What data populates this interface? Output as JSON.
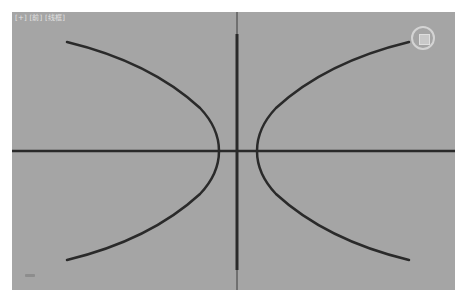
{
  "viewport": {
    "label_parts": [
      "[+]",
      "[前]",
      "[线框]"
    ],
    "background_color": "#a5a5a5",
    "line_color": "#2a2a2a"
  },
  "scene": {
    "objects": [
      {
        "name": "hyperbola-left-branch",
        "type": "curve",
        "start": [
          67,
          42
        ],
        "vertex": [
          219,
          151
        ],
        "end": [
          67,
          260
        ]
      },
      {
        "name": "hyperbola-right-branch",
        "type": "curve",
        "start": [
          409,
          42
        ],
        "vertex": [
          257,
          151
        ],
        "end": [
          409,
          260
        ]
      },
      {
        "name": "x-axis-line",
        "type": "line",
        "from": [
          12,
          151
        ],
        "to": [
          455,
          151
        ]
      },
      {
        "name": "y-axis-line",
        "type": "line",
        "from": [
          237,
          34
        ],
        "to": [
          237,
          270
        ]
      }
    ]
  },
  "widgets": {
    "viewcube": "viewcube-icon",
    "axis_tripod": "axis-tripod-icon"
  }
}
